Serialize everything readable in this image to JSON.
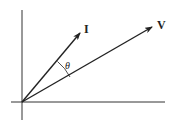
{
  "diagram": {
    "type": "phasor-diagram",
    "colors": {
      "stroke": "#222222",
      "background": "#ffffff"
    },
    "axes": {
      "origin": [
        22,
        102
      ],
      "horizontal": {
        "x1": 11,
        "x2": 165,
        "y": 102
      },
      "vertical": {
        "x": 22,
        "y1": 10,
        "y2": 120
      }
    },
    "vectors": [
      {
        "id": "current",
        "label": "I",
        "from": [
          22,
          102
        ],
        "to": [
          80,
          33
        ]
      },
      {
        "id": "voltage",
        "label": "V",
        "from": [
          22,
          102
        ],
        "to": [
          152,
          27
        ]
      }
    ],
    "angle": {
      "label": "θ",
      "between": [
        "I",
        "V"
      ]
    }
  }
}
